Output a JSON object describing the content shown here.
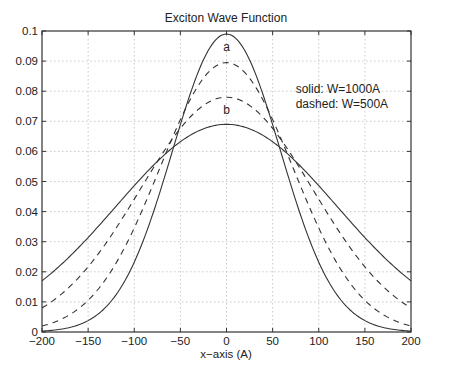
{
  "chart_data": {
    "type": "line",
    "title": "Exciton Wave Function",
    "xlabel": "x−axis  (A)",
    "ylabel": "",
    "xlim": [
      -200,
      200
    ],
    "ylim": [
      0,
      0.1
    ],
    "grid": true,
    "xticks": [
      -200,
      -150,
      -100,
      -50,
      0,
      50,
      100,
      150,
      200
    ],
    "xtick_labels": [
      "−200",
      "−150",
      "−100",
      "−50",
      "0",
      "50",
      "100",
      "150",
      "200"
    ],
    "yticks": [
      0,
      0.01,
      0.02,
      0.03,
      0.04,
      0.05,
      0.06,
      0.07,
      0.08,
      0.09,
      0.1
    ],
    "ytick_labels": [
      "0",
      "0.01",
      "0.02",
      "0.03",
      "0.04",
      "0.05",
      "0.06",
      "0.07",
      "0.08",
      "0.09",
      "0.1"
    ],
    "annotations": [
      {
        "text": "a",
        "x": 0,
        "y": 0.0935
      },
      {
        "text": "b",
        "x": 0,
        "y": 0.0725
      },
      {
        "text": "solid:  W=1000A",
        "x": 75,
        "y": 0.0795
      },
      {
        "text": "dashed: W=500A",
        "x": 75,
        "y": 0.0745
      }
    ],
    "series": [
      {
        "name": "a (solid, W=1000A)",
        "style": "solid",
        "peak": 0.099,
        "sigma": 58.7,
        "x": [
          -200,
          -150,
          -100,
          -50,
          0,
          50,
          100,
          150,
          200
        ],
        "values": [
          0.0003,
          0.0037,
          0.0232,
          0.0692,
          0.099,
          0.0692,
          0.0232,
          0.0037,
          0.0003
        ]
      },
      {
        "name": "a (dashed, W=500A)",
        "style": "dashed",
        "peak": 0.0895,
        "sigma": 72.5,
        "x": [
          -200,
          -150,
          -100,
          -50,
          0,
          50,
          100,
          150,
          200
        ],
        "values": [
          0.002,
          0.0105,
          0.0343,
          0.0704,
          0.0895,
          0.0704,
          0.0343,
          0.0105,
          0.002
        ]
      },
      {
        "name": "b (dashed, W=500A)",
        "style": "dashed",
        "peak": 0.078,
        "sigma": 93.7,
        "x": [
          -200,
          -150,
          -100,
          -50,
          0,
          50,
          100,
          150,
          200
        ],
        "values": [
          0.008,
          0.0217,
          0.044,
          0.0676,
          0.078,
          0.0676,
          0.044,
          0.0217,
          0.008
        ]
      },
      {
        "name": "b (solid, W=1000A)",
        "style": "solid",
        "peak": 0.069,
        "sigma": 119.5,
        "x": [
          -200,
          -150,
          -100,
          -50,
          0,
          50,
          100,
          150,
          200
        ],
        "values": [
          0.017,
          0.0315,
          0.0487,
          0.0633,
          0.069,
          0.0633,
          0.0487,
          0.0315,
          0.017
        ]
      }
    ]
  },
  "colors": {
    "line": "#333333",
    "grid": "#bbbbbb",
    "axis": "#333333"
  }
}
